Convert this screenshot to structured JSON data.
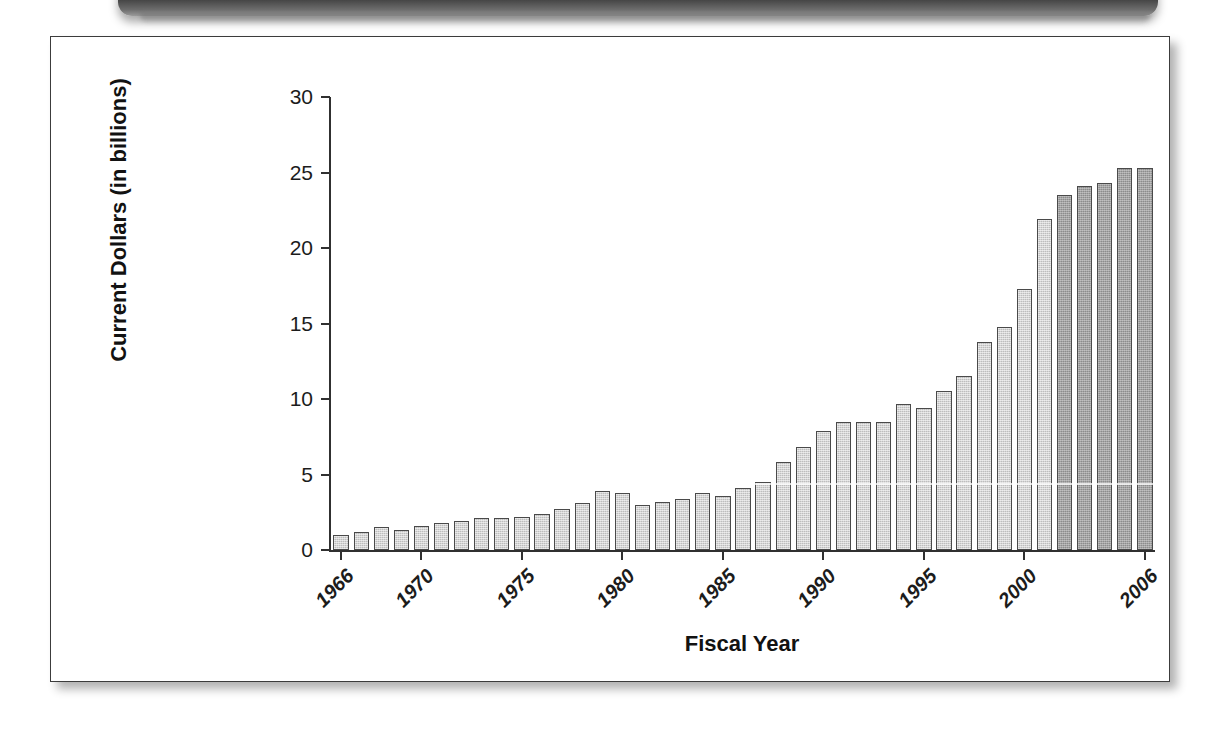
{
  "figure": {
    "frame_border_color": "#3c3c3c",
    "background": "#ffffff"
  },
  "banner": {
    "name": "top-banner-strip",
    "color": "#2e2e2e"
  },
  "chart_data": {
    "type": "bar",
    "title": "",
    "subtitle": "",
    "xlabel": "Fiscal Year",
    "ylabel": "Current Dollars (in billions)",
    "ylim": [
      0,
      30
    ],
    "yticks": [
      0,
      5,
      10,
      15,
      20,
      25,
      30
    ],
    "ytick_labels": [
      "0",
      "5",
      "10",
      "15",
      "20",
      "25",
      "30"
    ],
    "grid": false,
    "legend": null,
    "xtick_labels": [
      "1966",
      "1970",
      "1975",
      "1980",
      "1985",
      "1990",
      "1995",
      "2000",
      "2006"
    ],
    "xtick_years": [
      1966,
      1970,
      1975,
      1980,
      1985,
      1990,
      1995,
      2000,
      2006
    ],
    "bar_colors": {
      "light": "#bdbdbd",
      "dark": "#8c8c8c",
      "edge": "#4a4a4a"
    },
    "dark_from_year": 2002,
    "categories": [
      1966,
      1967,
      1968,
      1969,
      1970,
      1971,
      1972,
      1973,
      1974,
      1975,
      1976,
      1977,
      1978,
      1979,
      1980,
      1981,
      1982,
      1983,
      1984,
      1985,
      1986,
      1987,
      1988,
      1989,
      1990,
      1991,
      1992,
      1993,
      1994,
      1995,
      1996,
      1997,
      1998,
      1999,
      2000,
      2001,
      2002,
      2003,
      2004,
      2005,
      2006
    ],
    "values": [
      1.0,
      1.2,
      1.5,
      1.3,
      1.6,
      1.8,
      1.9,
      2.1,
      2.1,
      2.2,
      2.4,
      2.7,
      3.1,
      3.9,
      3.8,
      3.0,
      3.2,
      3.4,
      3.8,
      3.6,
      4.1,
      4.5,
      5.8,
      6.8,
      7.9,
      8.5,
      8.5,
      8.5,
      9.7,
      9.4,
      10.5,
      11.5,
      13.8,
      14.8,
      17.3,
      21.9,
      23.5,
      24.1,
      24.3,
      25.3,
      25.3
    ]
  }
}
